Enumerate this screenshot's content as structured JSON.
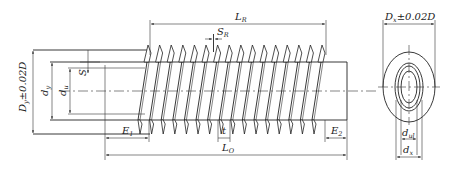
{
  "views": {
    "side_view": {
      "labels": {
        "finned_length": {
          "base": "L",
          "sub": "R"
        },
        "fin_thickness": {
          "base": "S",
          "sub": "R"
        },
        "outer_diameter": {
          "base": "D",
          "sub": "y",
          "tol": "±0.02D"
        },
        "tube_outer_diameter": {
          "base": "d",
          "sub": "y"
        },
        "tube_inner_diameter": {
          "base": "d",
          "sub": "u"
        },
        "wall_thickness": {
          "base": "S",
          "sub": ""
        },
        "end_length_1": {
          "base": "E",
          "sub": "1"
        },
        "end_length_2": {
          "base": "E",
          "sub": "2"
        },
        "pitch": {
          "base": "t",
          "sub": ""
        },
        "total_length": {
          "base": "L",
          "sub": "O"
        }
      },
      "fin_count": 16
    },
    "end_view": {
      "labels": {
        "outer_diameter": {
          "base": "D",
          "sub": "x",
          "tol": "±0.02D"
        },
        "inner_diameter": {
          "base": "d",
          "sub": "ul"
        },
        "tube_diameter": {
          "base": "d",
          "sub": "x"
        }
      }
    }
  }
}
